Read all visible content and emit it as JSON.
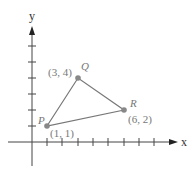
{
  "diagram": {
    "axes": {
      "x_label": "x",
      "y_label": "y",
      "x_ticks": [
        1,
        2,
        3,
        4,
        5,
        6,
        7,
        8
      ],
      "y_ticks": [
        1,
        2,
        3,
        4,
        5,
        6
      ]
    },
    "points": [
      {
        "name": "P",
        "coord_label": "(1, 1)",
        "x": 1,
        "y": 1
      },
      {
        "name": "Q",
        "coord_label": "(3, 4)",
        "x": 3,
        "y": 4
      },
      {
        "name": "R",
        "coord_label": "(6, 2)",
        "x": 6,
        "y": 2
      }
    ],
    "colors": {
      "axis": "#444444",
      "triangle": "#777777",
      "point": "#888888",
      "label": "#777777"
    }
  }
}
